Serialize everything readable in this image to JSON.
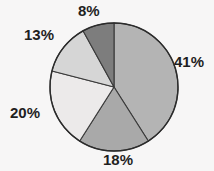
{
  "chart_data": {
    "type": "pie",
    "title": "",
    "subtitle": "",
    "xlabel": "",
    "ylabel": "",
    "legend": "none",
    "grid": false,
    "start_angle_deg": 90,
    "direction": "clockwise",
    "categories": [
      "41%",
      "18%",
      "20%",
      "13%",
      "8%"
    ],
    "values": [
      41,
      18,
      20,
      13,
      8
    ],
    "labels": [
      "41%",
      "18%",
      "20%",
      "13%",
      "8%"
    ],
    "label_position": "outside",
    "slices": [
      {
        "label": "41%",
        "value": 41,
        "color": "#b4b4b4",
        "position": "right"
      },
      {
        "label": "18%",
        "value": 18,
        "color": "#a9a9a9",
        "position": "bottom"
      },
      {
        "label": "20%",
        "value": 20,
        "color": "#eceaea",
        "position": "left"
      },
      {
        "label": "13%",
        "value": 13,
        "color": "#d6d6d6",
        "position": "upper-left"
      },
      {
        "label": "8%",
        "value": 8,
        "color": "#7d7d7d",
        "position": "top"
      }
    ],
    "total": 100
  },
  "style": {
    "background": "#f7f6f6",
    "outline_color": "#2b2b2b",
    "separator_color": "#3a3a3a",
    "label_color": "#1f1f1f"
  },
  "geometry": {
    "center_x": 114,
    "center_y": 87,
    "radius": 64
  }
}
